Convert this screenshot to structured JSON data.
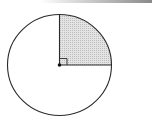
{
  "diagram": {
    "type": "circle-with-shaded-quarter-sector",
    "center": {
      "x": 59.5,
      "y": 65
    },
    "radius": {
      "rx": 52,
      "ry": 50.5
    },
    "shaded_sector": "top-right quadrant",
    "right_angle_marker": true,
    "center_dot": true,
    "colors": {
      "stroke": "#2a2a2a",
      "fill": "#d8d8d8",
      "background": "#ffffff"
    }
  }
}
